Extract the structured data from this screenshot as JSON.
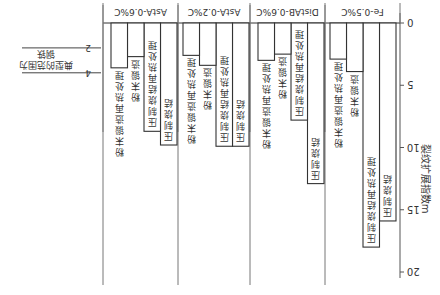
{
  "chart_data": {
    "type": "bar",
    "orientation": "rotated-180",
    "title": "",
    "ylabel": "裂纹扩展指数m",
    "xlabel": "",
    "ylim": [
      0,
      20
    ],
    "yticks": [
      0,
      5,
      10,
      15,
      20
    ],
    "grid": false,
    "categories": [
      "Fe-0.5%C",
      "DistAB-0.6%C",
      "AstA-0.2%C",
      "AstA-0.6%C"
    ],
    "series": [
      {
        "name": "压制烧结",
        "values": [
          15.9,
          12.9,
          9.9,
          9.8
        ]
      },
      {
        "name": "压制烧结再热处理",
        "values": [
          18.0,
          7.8,
          9.9,
          8.7
        ]
      },
      {
        "name": "粉末锻造",
        "values": [
          3.9,
          2.5,
          3.4,
          2.7
        ]
      },
      {
        "name": "粉末锻造再热处理",
        "values": [
          2.9,
          3.0,
          2.6,
          3.6
        ]
      }
    ],
    "annotation": {
      "text_line1": "典型的范围为",
      "text_line2": "钢铁",
      "range": [
        2,
        4
      ],
      "tick_labels": [
        "2",
        "4"
      ]
    }
  }
}
